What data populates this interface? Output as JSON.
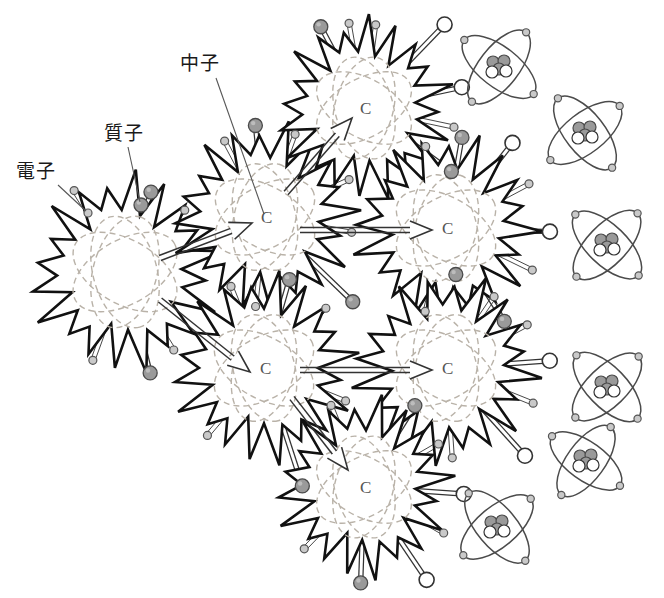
{
  "diagram": {
    "canvas": {
      "width": 664,
      "height": 598,
      "background": "#ffffff"
    },
    "colors": {
      "ink": "#1a1a1a",
      "burst_outline": "#111111",
      "orbit_dashed": "#b9b2a8",
      "proton_fill": "#9a9a9a",
      "proton_stroke": "#4a4a4a",
      "neutron_fill": "#ffffff",
      "neutron_stroke": "#333333",
      "electron_fill": "#c9c9c9",
      "electron_stroke": "#555555",
      "atom_stroke": "#4b4b4b",
      "ray_stroke": "#333333",
      "leader_stroke": "#555555"
    },
    "labels": [
      {
        "id": "electron",
        "text": "電子",
        "x": 16,
        "y": 162,
        "leader": {
          "x1": 58,
          "y1": 185,
          "x2": 86,
          "y2": 211
        }
      },
      {
        "id": "proton",
        "text": "質子",
        "x": 104,
        "y": 124,
        "leader": {
          "x1": 128,
          "y1": 147,
          "x2": 140,
          "y2": 202
        }
      },
      {
        "id": "neutron",
        "text": "中子",
        "x": 180,
        "y": 54,
        "leader": {
          "x1": 216,
          "y1": 78,
          "x2": 264,
          "y2": 214
        }
      }
    ],
    "particle_legend": [
      {
        "name": "proton",
        "label": "質子",
        "shape": "filled-gray-circle",
        "radius": 7
      },
      {
        "name": "neutron",
        "label": "中子",
        "shape": "hollow-white-circle",
        "radius": 7
      },
      {
        "name": "electron",
        "label": "電子",
        "shape": "small-gray-circle",
        "radius": 4
      }
    ],
    "bursts": [
      {
        "id": "burst-seed",
        "cx": 125,
        "cy": 272,
        "r": 92,
        "center_glyph": "",
        "spikes": 20,
        "rotate": 6
      },
      {
        "id": "burst-upper-mid",
        "cx": 265,
        "cy": 217,
        "r": 88,
        "center_glyph": "C",
        "spikes": 20,
        "rotate": 14
      },
      {
        "id": "burst-top",
        "cx": 364,
        "cy": 108,
        "r": 84,
        "center_glyph": "C",
        "spikes": 20,
        "rotate": 3
      },
      {
        "id": "burst-upper-right",
        "cx": 446,
        "cy": 228,
        "r": 88,
        "center_glyph": "C",
        "spikes": 20,
        "rotate": 20
      },
      {
        "id": "burst-lower-mid",
        "cx": 264,
        "cy": 368,
        "r": 88,
        "center_glyph": "C",
        "spikes": 20,
        "rotate": 9
      },
      {
        "id": "burst-lower-right",
        "cx": 446,
        "cy": 368,
        "r": 88,
        "center_glyph": "C",
        "spikes": 20,
        "rotate": 24
      },
      {
        "id": "burst-bottom",
        "cx": 364,
        "cy": 487,
        "r": 84,
        "center_glyph": "C",
        "spikes": 20,
        "rotate": 11
      }
    ],
    "chain_arrows": [
      {
        "id": "arrow-seed-to-upper-mid",
        "from": "burst-seed",
        "to": "burst-upper-mid",
        "x1": 160,
        "y1": 258,
        "x2": 252,
        "y2": 223
      },
      {
        "id": "arrow-seed-to-lower-mid",
        "from": "burst-seed",
        "to": "burst-lower-mid",
        "x1": 160,
        "y1": 300,
        "x2": 250,
        "y2": 372
      },
      {
        "id": "arrow-upper-mid-to-top",
        "from": "burst-upper-mid",
        "to": "burst-top",
        "x1": 286,
        "y1": 193,
        "x2": 352,
        "y2": 118
      },
      {
        "id": "arrow-upper-mid-to-right",
        "from": "burst-upper-mid",
        "to": "burst-upper-right",
        "x1": 300,
        "y1": 230,
        "x2": 432,
        "y2": 230
      },
      {
        "id": "arrow-lower-mid-to-right",
        "from": "burst-lower-mid",
        "to": "burst-lower-right",
        "x1": 300,
        "y1": 370,
        "x2": 432,
        "y2": 370
      },
      {
        "id": "arrow-lower-mid-to-bottom",
        "from": "burst-lower-mid",
        "to": "burst-bottom",
        "x1": 292,
        "y1": 398,
        "x2": 348,
        "y2": 470
      }
    ],
    "atoms": [
      {
        "id": "atom-1",
        "cx": 499,
        "cy": 67,
        "rx": 44,
        "ry": 20,
        "tilt": 38,
        "electrons": 4,
        "protons": 3,
        "neutrons": 2
      },
      {
        "id": "atom-2",
        "cx": 585,
        "cy": 133,
        "rx": 44,
        "ry": 20,
        "tilt": 52,
        "electrons": 4,
        "protons": 3,
        "neutrons": 2
      },
      {
        "id": "atom-3",
        "cx": 607,
        "cy": 245,
        "rx": 44,
        "ry": 20,
        "tilt": 44,
        "electrons": 4,
        "protons": 3,
        "neutrons": 2
      },
      {
        "id": "atom-4",
        "cx": 607,
        "cy": 387,
        "rx": 44,
        "ry": 20,
        "tilt": 46,
        "electrons": 4,
        "protons": 3,
        "neutrons": 2
      },
      {
        "id": "atom-5",
        "cx": 586,
        "cy": 461,
        "rx": 42,
        "ry": 19,
        "tilt": 36,
        "electrons": 4,
        "protons": 3,
        "neutrons": 2
      },
      {
        "id": "atom-6",
        "cx": 497,
        "cy": 527,
        "rx": 44,
        "ry": 20,
        "tilt": 50,
        "electrons": 4,
        "protons": 3,
        "neutrons": 2
      }
    ],
    "emissions": {
      "burst-seed": [
        {
          "type": "proton",
          "angle": -72,
          "len": 84
        },
        {
          "type": "electron",
          "angle": -122,
          "len": 96
        },
        {
          "type": "electron",
          "angle": -46,
          "len": 86
        },
        {
          "type": "electron",
          "angle": 58,
          "len": 92
        },
        {
          "type": "proton",
          "angle": 76,
          "len": 104
        },
        {
          "type": "electron",
          "angle": 110,
          "len": 94
        }
      ],
      "burst-upper-mid": [
        {
          "type": "proton",
          "angle": -96,
          "len": 92
        },
        {
          "type": "electron",
          "angle": -118,
          "len": 86
        },
        {
          "type": "electron",
          "angle": -70,
          "len": 88
        },
        {
          "type": "electron",
          "angle": -24,
          "len": 92
        },
        {
          "type": "electron",
          "angle": 10,
          "len": 88
        },
        {
          "type": "proton",
          "angle": 44,
          "len": 122
        },
        {
          "type": "electron",
          "angle": 96,
          "len": 90
        }
      ],
      "burst-top": [
        {
          "type": "proton",
          "angle": -118,
          "len": 92
        },
        {
          "type": "electron",
          "angle": -100,
          "len": 86
        },
        {
          "type": "electron",
          "angle": -82,
          "len": 84
        },
        {
          "type": "neutron",
          "angle": -46,
          "len": 116
        },
        {
          "type": "neutron",
          "angle": -12,
          "len": 100
        },
        {
          "type": "electron",
          "angle": 12,
          "len": 92
        },
        {
          "type": "proton",
          "angle": 36,
          "len": 108
        }
      ],
      "burst-upper-right": [
        {
          "type": "proton",
          "angle": -80,
          "len": 92
        },
        {
          "type": "electron",
          "angle": -104,
          "len": 84
        },
        {
          "type": "neutron",
          "angle": -52,
          "len": 108
        },
        {
          "type": "electron",
          "angle": -28,
          "len": 94
        },
        {
          "type": "neutron",
          "angle": 2,
          "len": 104
        },
        {
          "type": "electron",
          "angle": 26,
          "len": 96
        },
        {
          "type": "proton",
          "angle": 58,
          "len": 110
        },
        {
          "type": "electron",
          "angle": 104,
          "len": 86
        }
      ],
      "burst-lower-mid": [
        {
          "type": "electron",
          "angle": -112,
          "len": 88
        },
        {
          "type": "proton",
          "angle": -74,
          "len": 92
        },
        {
          "type": "electron",
          "angle": -44,
          "len": 86
        },
        {
          "type": "electron",
          "angle": 22,
          "len": 88
        },
        {
          "type": "proton",
          "angle": 72,
          "len": 124
        },
        {
          "type": "electron",
          "angle": 130,
          "len": 88
        }
      ],
      "burst-lower-right": [
        {
          "type": "proton",
          "angle": -84,
          "len": 94
        },
        {
          "type": "electron",
          "angle": -56,
          "len": 86
        },
        {
          "type": "electron",
          "angle": -28,
          "len": 92
        },
        {
          "type": "neutron",
          "angle": -4,
          "len": 104
        },
        {
          "type": "electron",
          "angle": 22,
          "len": 94
        },
        {
          "type": "neutron",
          "angle": 48,
          "len": 118
        },
        {
          "type": "electron",
          "angle": 86,
          "len": 90
        }
      ],
      "burst-bottom": [
        {
          "type": "electron",
          "angle": -112,
          "len": 88
        },
        {
          "type": "proton",
          "angle": -58,
          "len": 96
        },
        {
          "type": "electron",
          "angle": -30,
          "len": 86
        },
        {
          "type": "neutron",
          "angle": 4,
          "len": 100
        },
        {
          "type": "electron",
          "angle": 30,
          "len": 92
        },
        {
          "type": "neutron",
          "angle": 56,
          "len": 112
        },
        {
          "type": "proton",
          "angle": 92,
          "len": 96
        },
        {
          "type": "electron",
          "angle": 134,
          "len": 86
        }
      ]
    }
  }
}
